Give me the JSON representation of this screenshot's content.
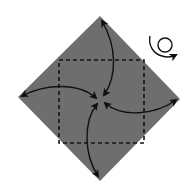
{
  "diagram": {
    "type": "origami-fold-step",
    "paper": {
      "shape": "square-rotated-45",
      "fill": "#6e6e6e"
    },
    "creases": {
      "style": "dashed",
      "shape": "square",
      "color": "#1a1a1a"
    },
    "arrows": [
      {
        "name": "top-corner-to-center",
        "direction": "two-way"
      },
      {
        "name": "left-corner-to-center",
        "direction": "two-way"
      },
      {
        "name": "right-corner-to-center",
        "direction": "two-way"
      },
      {
        "name": "bottom-corner-to-center",
        "direction": "two-way"
      }
    ],
    "symbols": [
      {
        "name": "turn-over",
        "meaning": "turn the model over"
      }
    ],
    "colors": {
      "paper": "#6e6e6e",
      "lines": "#111111",
      "background": "#ffffff"
    }
  }
}
